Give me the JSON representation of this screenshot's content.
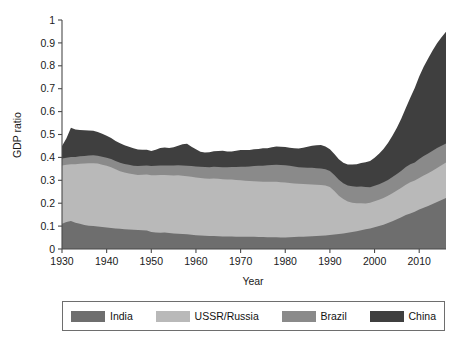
{
  "chart_data": {
    "type": "area",
    "stacked": true,
    "title": "",
    "subtitle": "",
    "xlabel": "Year",
    "ylabel": "GDP ratio",
    "xlim": [
      1930,
      2016
    ],
    "ylim": [
      0,
      1
    ],
    "grid": false,
    "legend_position": "bottom",
    "xticks": [
      1930,
      1940,
      1950,
      1960,
      1970,
      1980,
      1990,
      2000,
      2010
    ],
    "xtick_labels": [
      "1930",
      "1940",
      "1950",
      "1960",
      "1970",
      "1980",
      "1990",
      "2000",
      "2010"
    ],
    "yticks": [
      0,
      0.1,
      0.2,
      0.3,
      0.4,
      0.5,
      0.6,
      0.7,
      0.8,
      0.9,
      1
    ],
    "ytick_labels": [
      "0",
      "0.1",
      "0.2",
      "0.3",
      "0.4",
      "0.5",
      "0.6",
      "0.7",
      "0.8",
      "0.9",
      "1"
    ],
    "x": [
      1930,
      1931,
      1932,
      1933,
      1934,
      1935,
      1936,
      1937,
      1938,
      1939,
      1940,
      1941,
      1942,
      1943,
      1944,
      1945,
      1946,
      1947,
      1948,
      1949,
      1950,
      1951,
      1952,
      1953,
      1954,
      1955,
      1956,
      1957,
      1958,
      1959,
      1960,
      1961,
      1962,
      1963,
      1964,
      1965,
      1966,
      1967,
      1968,
      1969,
      1970,
      1971,
      1972,
      1973,
      1974,
      1975,
      1976,
      1977,
      1978,
      1979,
      1980,
      1981,
      1982,
      1983,
      1984,
      1985,
      1986,
      1987,
      1988,
      1989,
      1990,
      1991,
      1992,
      1993,
      1994,
      1995,
      1996,
      1997,
      1998,
      1999,
      2000,
      2001,
      2002,
      2003,
      2004,
      2005,
      2006,
      2007,
      2008,
      2009,
      2010,
      2011,
      2012,
      2013,
      2014,
      2015,
      2016
    ],
    "series": [
      {
        "name": "India",
        "color": "#6e6e6e",
        "values": [
          0.11,
          0.118,
          0.122,
          0.115,
          0.11,
          0.105,
          0.102,
          0.1,
          0.098,
          0.096,
          0.094,
          0.092,
          0.09,
          0.088,
          0.086,
          0.085,
          0.084,
          0.083,
          0.082,
          0.081,
          0.074,
          0.072,
          0.071,
          0.072,
          0.07,
          0.068,
          0.067,
          0.065,
          0.064,
          0.062,
          0.06,
          0.059,
          0.058,
          0.057,
          0.057,
          0.056,
          0.055,
          0.055,
          0.055,
          0.054,
          0.054,
          0.053,
          0.053,
          0.053,
          0.052,
          0.052,
          0.051,
          0.051,
          0.051,
          0.05,
          0.05,
          0.051,
          0.052,
          0.053,
          0.054,
          0.055,
          0.056,
          0.057,
          0.058,
          0.059,
          0.061,
          0.063,
          0.065,
          0.068,
          0.071,
          0.074,
          0.078,
          0.082,
          0.086,
          0.09,
          0.095,
          0.1,
          0.106,
          0.113,
          0.121,
          0.13,
          0.139,
          0.148,
          0.155,
          0.163,
          0.172,
          0.18,
          0.188,
          0.196,
          0.205,
          0.214,
          0.223
        ]
      },
      {
        "name": "USSR/Russia",
        "color": "#b9b9b9",
        "values": [
          0.255,
          0.25,
          0.248,
          0.255,
          0.262,
          0.268,
          0.272,
          0.275,
          0.275,
          0.272,
          0.27,
          0.265,
          0.258,
          0.252,
          0.248,
          0.245,
          0.242,
          0.24,
          0.242,
          0.244,
          0.248,
          0.25,
          0.252,
          0.251,
          0.252,
          0.253,
          0.255,
          0.255,
          0.254,
          0.253,
          0.252,
          0.251,
          0.25,
          0.25,
          0.251,
          0.251,
          0.25,
          0.249,
          0.248,
          0.247,
          0.246,
          0.245,
          0.244,
          0.243,
          0.243,
          0.242,
          0.243,
          0.243,
          0.243,
          0.242,
          0.24,
          0.237,
          0.234,
          0.232,
          0.23,
          0.228,
          0.226,
          0.224,
          0.222,
          0.218,
          0.21,
          0.19,
          0.168,
          0.15,
          0.136,
          0.128,
          0.122,
          0.118,
          0.113,
          0.112,
          0.113,
          0.115,
          0.117,
          0.119,
          0.122,
          0.125,
          0.129,
          0.133,
          0.136,
          0.136,
          0.138,
          0.141,
          0.143,
          0.146,
          0.149,
          0.152,
          0.155
        ]
      },
      {
        "name": "Brazil",
        "color": "#8a8a8a",
        "values": [
          0.03,
          0.031,
          0.032,
          0.032,
          0.033,
          0.033,
          0.034,
          0.034,
          0.034,
          0.035,
          0.035,
          0.036,
          0.036,
          0.037,
          0.037,
          0.038,
          0.038,
          0.039,
          0.039,
          0.04,
          0.04,
          0.041,
          0.042,
          0.042,
          0.043,
          0.044,
          0.044,
          0.045,
          0.046,
          0.047,
          0.048,
          0.049,
          0.05,
          0.05,
          0.051,
          0.051,
          0.052,
          0.053,
          0.055,
          0.057,
          0.059,
          0.061,
          0.063,
          0.066,
          0.068,
          0.07,
          0.072,
          0.073,
          0.074,
          0.075,
          0.076,
          0.075,
          0.074,
          0.072,
          0.072,
          0.072,
          0.073,
          0.072,
          0.071,
          0.071,
          0.07,
          0.07,
          0.069,
          0.069,
          0.07,
          0.072,
          0.072,
          0.073,
          0.072,
          0.068,
          0.068,
          0.068,
          0.068,
          0.069,
          0.071,
          0.072,
          0.074,
          0.077,
          0.079,
          0.079,
          0.083,
          0.085,
          0.086,
          0.087,
          0.087,
          0.085,
          0.083
        ]
      },
      {
        "name": "China",
        "color": "#3f3f3f",
        "values": [
          0.055,
          0.085,
          0.128,
          0.12,
          0.115,
          0.113,
          0.11,
          0.107,
          0.104,
          0.1,
          0.096,
          0.092,
          0.088,
          0.085,
          0.082,
          0.079,
          0.076,
          0.073,
          0.07,
          0.068,
          0.066,
          0.07,
          0.076,
          0.078,
          0.076,
          0.079,
          0.085,
          0.092,
          0.096,
          0.085,
          0.076,
          0.066,
          0.063,
          0.065,
          0.068,
          0.07,
          0.072,
          0.069,
          0.068,
          0.071,
          0.073,
          0.073,
          0.072,
          0.074,
          0.074,
          0.076,
          0.074,
          0.077,
          0.08,
          0.08,
          0.079,
          0.079,
          0.08,
          0.082,
          0.086,
          0.092,
          0.096,
          0.1,
          0.103,
          0.1,
          0.095,
          0.092,
          0.09,
          0.09,
          0.092,
          0.095,
          0.098,
          0.103,
          0.108,
          0.114,
          0.122,
          0.133,
          0.146,
          0.162,
          0.18,
          0.202,
          0.228,
          0.258,
          0.29,
          0.325,
          0.36,
          0.39,
          0.415,
          0.438,
          0.458,
          0.474,
          0.488
        ]
      }
    ]
  },
  "legend": {
    "items": [
      {
        "label": "India",
        "color": "#6e6e6e"
      },
      {
        "label": "USSR/Russia",
        "color": "#b9b9b9"
      },
      {
        "label": "Brazil",
        "color": "#8a8a8a"
      },
      {
        "label": "China",
        "color": "#3f3f3f"
      }
    ]
  },
  "axes": {
    "ylabel": "GDP ratio",
    "xlabel": "Year"
  },
  "colors": {
    "axis": "#4a4a4a",
    "text": "#1a1a1a",
    "background": "#ffffff",
    "legend_border": "#6e6e6e"
  }
}
